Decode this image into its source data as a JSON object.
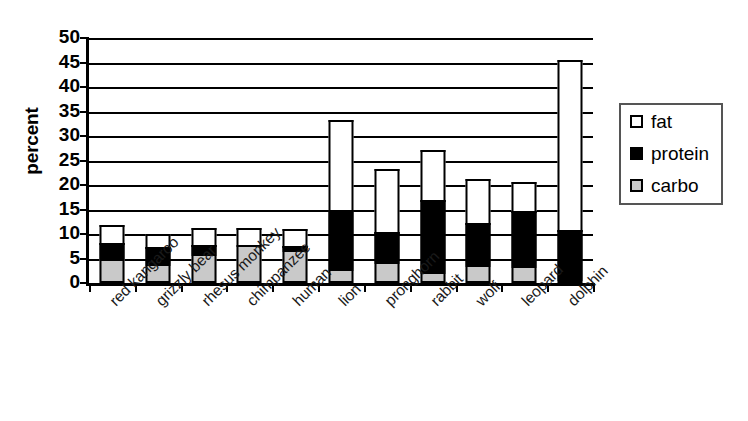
{
  "chart_data": {
    "type": "bar",
    "subtype": "stacked",
    "title": "",
    "xlabel": "",
    "ylabel": "percent",
    "ylim": [
      0,
      50
    ],
    "ytick_step": 5,
    "yticks": [
      50,
      45,
      40,
      35,
      30,
      25,
      20,
      15,
      10,
      5,
      0
    ],
    "grid": true,
    "legend_position": "right",
    "categories": [
      "red kangaroo",
      "grizzly bear",
      "rhesus monkey",
      "chimpanzee",
      "human",
      "lion",
      "pronghorn",
      "rabbit",
      "wolf",
      "leopard",
      "dolphin"
    ],
    "series": [
      {
        "name": "carbo",
        "color": "#c9c9c9",
        "values": [
          4.8,
          3.8,
          6.0,
          7.8,
          6.8,
          2.8,
          4.2,
          2.2,
          3.6,
          3.4,
          0.5
        ]
      },
      {
        "name": "protein",
        "color": "#000000",
        "values": [
          3.8,
          4.0,
          2.2,
          0.4,
          1.2,
          12.6,
          6.6,
          15.2,
          9.0,
          11.8,
          10.5
        ]
      },
      {
        "name": "fat",
        "color": "#ffffff",
        "values": [
          4.1,
          3.0,
          3.8,
          3.8,
          3.8,
          18.6,
          13.2,
          10.6,
          9.4,
          6.3,
          35.0
        ]
      }
    ],
    "totals": [
      12.7,
      10.8,
      12.0,
      12.0,
      11.8,
      34.0,
      24.0,
      28.0,
      22.0,
      21.5,
      46.0
    ]
  },
  "legend": {
    "items": [
      {
        "label": "fat",
        "key": "fat"
      },
      {
        "label": "protein",
        "key": "protein"
      },
      {
        "label": "carbo",
        "key": "carbo"
      }
    ]
  }
}
